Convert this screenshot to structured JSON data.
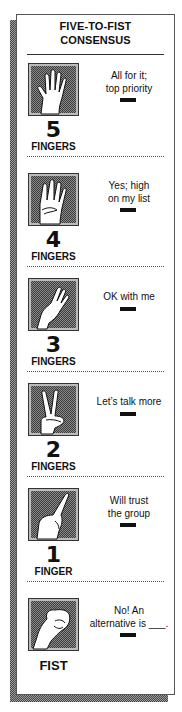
{
  "title": {
    "line1": "FIVE-TO-FIST",
    "line2": "CONSENSUS"
  },
  "colors": {
    "ink": "#111111",
    "border": "#555555",
    "pattern_dark": "#3d3d3d",
    "pattern_light": "#8a8a8a",
    "background": "#ffffff"
  },
  "sections": [
    {
      "icon": "open-hand-five-fingers-icon",
      "number": "5",
      "label": "FINGERS",
      "desc_line1": "All for it;",
      "desc_line2": "top priority"
    },
    {
      "icon": "four-fingers-hand-icon",
      "number": "4",
      "label": "FINGERS",
      "desc_line1": "Yes; high",
      "desc_line2": "on my list"
    },
    {
      "icon": "three-fingers-hand-icon",
      "number": "3",
      "label": "FINGERS",
      "desc_line1": "OK with me",
      "desc_line2": ""
    },
    {
      "icon": "two-fingers-hand-icon",
      "number": "2",
      "label": "FINGERS",
      "desc_line1": "Let’s talk more",
      "desc_line2": ""
    },
    {
      "icon": "one-finger-hand-icon",
      "number": "1",
      "label": "FINGER",
      "desc_line1": "Will trust",
      "desc_line2": "the group"
    },
    {
      "icon": "fist-hand-icon",
      "number": "",
      "label": "FIST",
      "desc_line1": "No! An",
      "desc_line2": "alternative is ___."
    }
  ]
}
